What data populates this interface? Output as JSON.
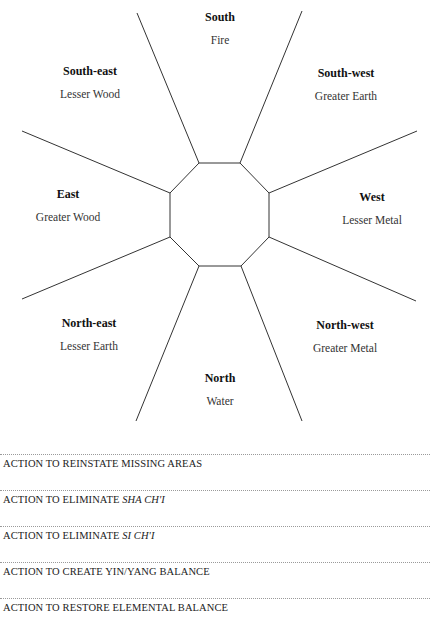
{
  "diagram": {
    "sectors": [
      {
        "id": "south",
        "direction": "South",
        "element": "Fire",
        "x": 220,
        "y": 10
      },
      {
        "id": "south-east",
        "direction": "South-east",
        "element": "Lesser Wood",
        "x": 90,
        "y": 64
      },
      {
        "id": "south-west",
        "direction": "South-west",
        "element": "Greater Earth",
        "x": 346,
        "y": 66
      },
      {
        "id": "east",
        "direction": "East",
        "element": "Greater Wood",
        "x": 68,
        "y": 187
      },
      {
        "id": "west",
        "direction": "West",
        "element": "Lesser Metal",
        "x": 372,
        "y": 190
      },
      {
        "id": "north-east",
        "direction": "North-east",
        "element": "Lesser Earth",
        "x": 89,
        "y": 316
      },
      {
        "id": "north-west",
        "direction": "North-west",
        "element": "Greater Metal",
        "x": 345,
        "y": 318
      },
      {
        "id": "north",
        "direction": "North",
        "element": "Water",
        "x": 220,
        "y": 371
      }
    ],
    "line_color": "#333333"
  },
  "actions": [
    {
      "prefix": "ACTION TO REINSTATE MISSING AREAS",
      "italic": ""
    },
    {
      "prefix": "ACTION TO ELIMINATE ",
      "italic": "SHA CH'I"
    },
    {
      "prefix": "ACTION TO ELIMINATE ",
      "italic": "SI CH'I"
    },
    {
      "prefix": "ACTION TO CREATE YIN/YANG BALANCE",
      "italic": ""
    },
    {
      "prefix": "ACTION TO RESTORE ELEMENTAL BALANCE",
      "italic": ""
    }
  ]
}
